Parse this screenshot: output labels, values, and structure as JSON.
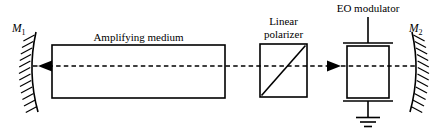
{
  "figure": {
    "type": "optics-schematic",
    "title_visible": false,
    "background_color": "#ffffff",
    "line_color": "#000000",
    "beam_axis_y": 66
  },
  "labels": {
    "mirror_left": {
      "symbol": "M",
      "subscript": "1",
      "full": "M1"
    },
    "mirror_right": {
      "symbol": "M",
      "subscript": "2",
      "full": "M2"
    },
    "amplifying_medium": "Amplifying medium",
    "linear_polarizer_line1": "Linear",
    "linear_polarizer_line2": "polarizer",
    "eo_modulator": "EO modulator"
  },
  "components": [
    {
      "id": "mirror-m1",
      "name": "M1",
      "kind": "concave-mirror",
      "hatching_side": "left",
      "x": 30,
      "y_top": 32,
      "y_bottom": 112
    },
    {
      "id": "amplifying-medium",
      "name": "Amplifying medium",
      "kind": "rectangle",
      "x": 52,
      "y": 45,
      "width": 173,
      "height": 53
    },
    {
      "id": "linear-polarizer",
      "name": "Linear polarizer",
      "kind": "square-with-diagonal",
      "x": 260,
      "y": 44,
      "width": 47,
      "height": 53,
      "diagonal": "bottom-left-to-top-right"
    },
    {
      "id": "eo-modulator",
      "name": "EO modulator",
      "kind": "crystal-with-electrodes",
      "x": 347,
      "y": 46,
      "width": 42,
      "height": 52,
      "has_top_lead": true,
      "has_ground_symbol": true
    },
    {
      "id": "mirror-m2",
      "name": "M2",
      "kind": "concave-mirror",
      "hatching_side": "right",
      "x": 415,
      "y_top": 32,
      "y_bottom": 112
    }
  ],
  "beam": {
    "kind": "dashed-line",
    "y": 66,
    "x_start": 33,
    "x_end": 418,
    "arrows": [
      {
        "id": "arrow-left",
        "direction": "left",
        "tip_x": 38,
        "y": 66
      },
      {
        "id": "arrow-right",
        "direction": "right",
        "tip_x": 341,
        "y": 66
      }
    ]
  }
}
